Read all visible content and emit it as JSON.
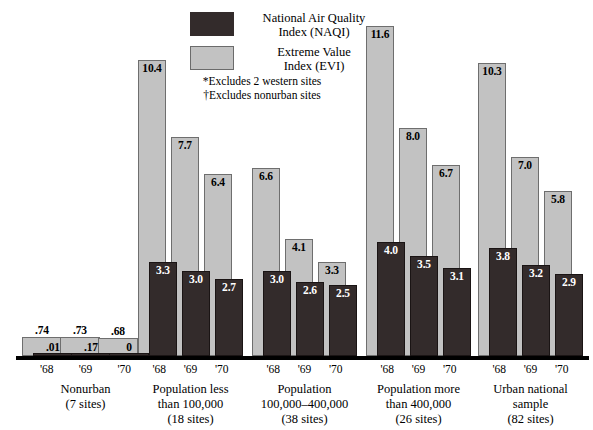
{
  "legend": {
    "items": [
      {
        "key": "naqi",
        "line1": "National Air Quality",
        "line2": "Index (NAQI)",
        "color": "#332b2b"
      },
      {
        "key": "evi",
        "line1": "Extreme Value",
        "line2": "Index (EVI)",
        "color": "#c2c2c2"
      }
    ]
  },
  "footnotes": {
    "line1": "*Excludes 2 western sites",
    "line2": "†Excludes nonurban sites"
  },
  "ticks": {
    "y68": "'68",
    "y69": "'69",
    "y70": "'70"
  },
  "groups": [
    {
      "id": "nonurban",
      "label_lines": [
        "Nonurban",
        "(7 sites)"
      ],
      "ticks": [
        "'68",
        "'69",
        "'70"
      ],
      "evi": [
        "0.74",
        "0.73",
        "0.68"
      ],
      "naqi": [
        ".01",
        ".17",
        "0"
      ],
      "evi_labels": [
        ".74",
        ".73",
        ".68"
      ],
      "naqi_labels": [
        ".01",
        ".17",
        "0"
      ]
    },
    {
      "id": "pop-less-100k",
      "label_lines": [
        "Population less",
        "than 100,000",
        "(18 sites)"
      ],
      "ticks": [
        "'68",
        "'69",
        "'70"
      ],
      "evi": [
        "10.4",
        "7.7",
        "6.4"
      ],
      "naqi": [
        "3.3",
        "3.0",
        "2.7"
      ],
      "evi_labels": [
        "10.4",
        "7.7",
        "6.4"
      ],
      "naqi_labels": [
        "3.3",
        "3.0",
        "2.7"
      ]
    },
    {
      "id": "pop-100k-400k",
      "label_lines": [
        "Population",
        "100,000–400,000",
        "(38 sites)"
      ],
      "ticks": [
        "'68",
        "'69",
        "'70"
      ],
      "evi": [
        "6.6",
        "4.1",
        "3.3"
      ],
      "naqi": [
        "3.0",
        "2.6",
        "2.5"
      ],
      "evi_labels": [
        "6.6",
        "4.1",
        "3.3"
      ],
      "naqi_labels": [
        "3.0",
        "2.6",
        "2.5"
      ]
    },
    {
      "id": "pop-more-400k",
      "label_lines": [
        "Population more",
        "than 400,000",
        "(26 sites)"
      ],
      "ticks": [
        "'68",
        "'69",
        "'70"
      ],
      "evi": [
        "11.6",
        "8.0",
        "6.7"
      ],
      "naqi": [
        "4.0",
        "3.5",
        "3.1"
      ],
      "evi_labels": [
        "11.6",
        "8.0",
        "6.7"
      ],
      "naqi_labels": [
        "4.0",
        "3.5",
        "3.1"
      ]
    },
    {
      "id": "urban-national",
      "label_lines": [
        "Urban national",
        "sample",
        "(82 sites)"
      ],
      "ticks": [
        "'68",
        "'69",
        "'70"
      ],
      "evi": [
        "10.3",
        "7.0",
        "5.8"
      ],
      "naqi": [
        "3.8",
        "3.2",
        "2.9"
      ],
      "evi_labels": [
        "10.3",
        "7.0",
        "5.8"
      ],
      "naqi_labels": [
        "3.8",
        "3.2",
        "2.9"
      ]
    }
  ],
  "chart_data": {
    "type": "bar",
    "title": "",
    "xlabel": "",
    "ylabel": "",
    "grid": false,
    "legend_position": "top-center",
    "categories": [
      "Nonurban (7 sites)",
      "Population less than 100,000 (18 sites)",
      "Population 100,000–400,000 (38 sites)",
      "Population more than 400,000 (26 sites)",
      "Urban national sample (82 sites)"
    ],
    "subgroups": [
      "'68",
      "'69",
      "'70"
    ],
    "series": [
      {
        "name": "National Air Quality Index (NAQI)",
        "color": "#332b2b",
        "values": [
          [
            0.01,
            0.17,
            0.0
          ],
          [
            3.3,
            3.0,
            2.7
          ],
          [
            3.0,
            2.6,
            2.5
          ],
          [
            4.0,
            3.5,
            3.1
          ],
          [
            3.8,
            3.2,
            2.9
          ]
        ]
      },
      {
        "name": "Extreme Value Index (EVI)",
        "color": "#c2c2c2",
        "values": [
          [
            0.74,
            0.73,
            0.68
          ],
          [
            10.4,
            7.7,
            6.4
          ],
          [
            6.6,
            4.1,
            3.3
          ],
          [
            11.6,
            8.0,
            6.7
          ],
          [
            10.3,
            7.0,
            5.8
          ]
        ]
      }
    ],
    "ylim": [
      0,
      11.6
    ],
    "notes": [
      "*Excludes 2 western sites",
      "†Excludes nonurban sites"
    ]
  }
}
